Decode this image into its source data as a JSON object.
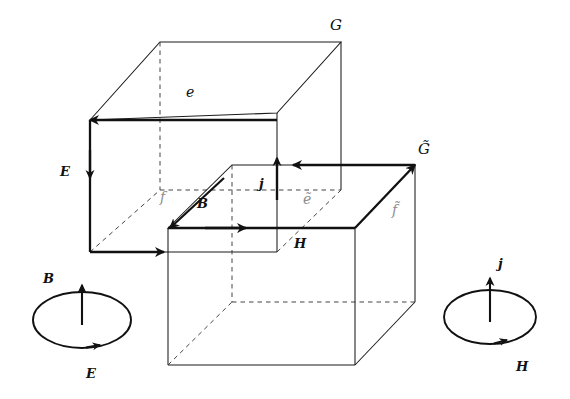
{
  "figure": {
    "background_color": "#ffffff",
    "line_color": "#1a1a1a",
    "dashed_line_color": "#333333",
    "faint_label_color": "#8d8d8d",
    "width": 570,
    "height": 399
  },
  "labels": {
    "grid_primal": "G",
    "grid_dual": "G̃",
    "edge_primal": "e",
    "edge_dual": "ẽ",
    "face_primal": "f",
    "face_dual": "f̃",
    "electric_field": "E",
    "magnetic_flux": "B",
    "magnetic_field": "H",
    "current_density": "j"
  },
  "primal_cube": {
    "name": "upper-left-cube",
    "label": "G",
    "highlighted_edge_label": "e",
    "highlighted_face_label": "f",
    "edge_arrow_field": "E",
    "face_arrow_field": "B"
  },
  "dual_cube": {
    "name": "lower-right-cube",
    "label": "G̃",
    "highlighted_edge_label": "ẽ",
    "highlighted_face_label": "f̃",
    "edge_arrow_field": "H",
    "face_arrow_field": "j"
  },
  "inset_left": {
    "name": "faraday-law-inset",
    "axis_label": "B",
    "loop_label": "E"
  },
  "inset_right": {
    "name": "ampere-law-inset",
    "axis_label": "j",
    "loop_label": "H"
  }
}
